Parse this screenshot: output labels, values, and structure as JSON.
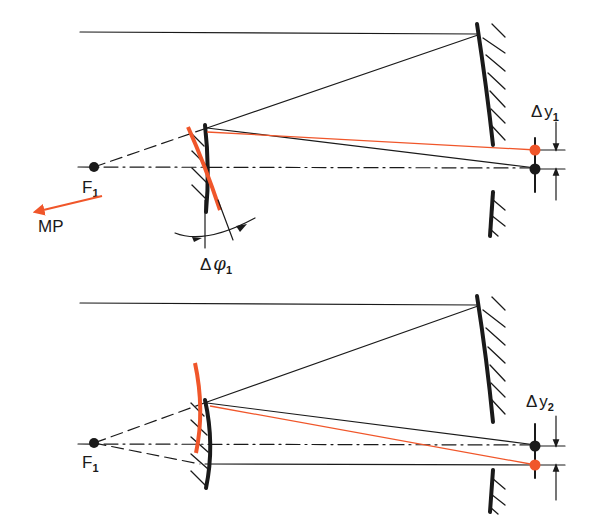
{
  "colors": {
    "ink": "#1a1a1a",
    "accent": "#f0562a",
    "background": "#ffffff"
  },
  "panels": [
    {
      "id": "top",
      "focus_label": "F",
      "focus_sub": "1",
      "arrow_label": "MP",
      "angle_label_prefix": "Δ",
      "angle_symbol": "φ",
      "angle_sub": "1",
      "shift_label_prefix": "Δ",
      "shift_symbol": "y",
      "shift_sub": "1"
    },
    {
      "id": "bottom",
      "focus_label": "F",
      "focus_sub": "1",
      "shift_label_prefix": "Δ",
      "shift_symbol": "y",
      "shift_sub": "2"
    }
  ]
}
